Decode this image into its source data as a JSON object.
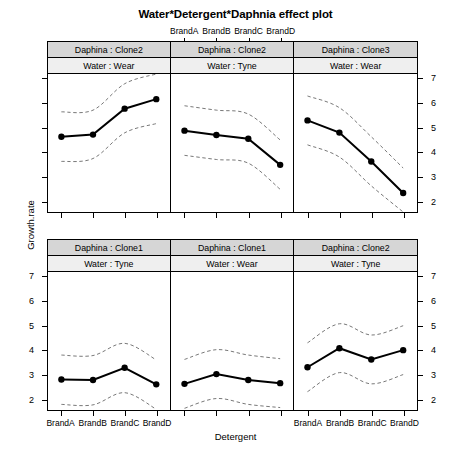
{
  "title": "Water*Detergent*Daphnia effect plot",
  "axes": {
    "xlabel": "Detergent",
    "ylabel": "Growth.rate",
    "categories": [
      "BrandA",
      "BrandB",
      "BrandC",
      "BrandD"
    ],
    "yticks": [
      "2",
      "3",
      "4",
      "5",
      "6",
      "7"
    ],
    "ylim": [
      1.55,
      7.2
    ]
  },
  "chart_data": {
    "type": "line",
    "title": "Water*Detergent*Daphnia effect plot",
    "xlabel": "Detergent",
    "ylabel": "Growth.rate",
    "categories": [
      "BrandA",
      "BrandB",
      "BrandC",
      "BrandD"
    ],
    "ylim": [
      1.55,
      7.2
    ],
    "yticks": [
      2,
      3,
      4,
      5,
      6,
      7
    ],
    "grid": false,
    "legend": null,
    "annotations": "Dashed lines are pointwise 95% confidence bands around each fitted effect line.",
    "panel_layout": {
      "rows": 2,
      "cols": 3
    },
    "panels": [
      {
        "position": "top-left",
        "strip_labels": [
          "Daphina : Clone2",
          "Water : Wear"
        ],
        "values": [
          4.63,
          4.72,
          5.78,
          6.17
        ],
        "lower": [
          3.62,
          3.74,
          4.79,
          5.17
        ],
        "upper": [
          5.65,
          5.72,
          6.8,
          7.2
        ]
      },
      {
        "position": "top-middle",
        "strip_labels": [
          "Daphina : Clone2",
          "Water : Tyne"
        ],
        "values": [
          4.88,
          4.7,
          4.55,
          3.48
        ],
        "lower": [
          3.87,
          3.7,
          3.55,
          2.48
        ],
        "upper": [
          5.9,
          5.72,
          5.56,
          4.5
        ]
      },
      {
        "position": "top-right",
        "strip_labels": [
          "Daphina : Clone3",
          "Water : Wear"
        ],
        "values": [
          5.3,
          4.8,
          3.62,
          2.33
        ],
        "lower": [
          4.3,
          3.8,
          2.62,
          1.55
        ],
        "upper": [
          6.3,
          5.82,
          4.63,
          3.35
        ]
      },
      {
        "position": "bottom-left",
        "strip_labels": [
          "Daphina : Clone1",
          "Water : Tyne"
        ],
        "values": [
          2.8,
          2.78,
          3.28,
          2.6
        ],
        "lower": [
          1.78,
          1.76,
          2.26,
          1.58
        ],
        "upper": [
          3.8,
          3.78,
          4.28,
          3.6
        ]
      },
      {
        "position": "bottom-middle",
        "strip_labels": [
          "Daphina : Clone1",
          "Water : Wear"
        ],
        "values": [
          2.62,
          3.02,
          2.78,
          2.65
        ],
        "lower": [
          1.62,
          2.02,
          1.78,
          1.65
        ],
        "upper": [
          3.62,
          4.02,
          3.8,
          3.65
        ]
      },
      {
        "position": "bottom-right",
        "strip_labels": [
          "Daphina : Clone2",
          "Water : Tyne"
        ],
        "values": [
          3.3,
          4.08,
          3.62,
          4.0
        ],
        "lower": [
          2.3,
          3.08,
          2.62,
          3.0
        ],
        "upper": [
          4.3,
          5.08,
          4.62,
          5.0
        ]
      }
    ]
  },
  "panel_strips": {
    "p0": {
      "top": "Daphina : Clone2",
      "bottom": "Water : Wear"
    },
    "p1": {
      "top": "Daphina : Clone2",
      "bottom": "Water : Tyne"
    },
    "p2": {
      "top": "Daphina : Clone3",
      "bottom": "Water : Wear"
    },
    "p3": {
      "top": "Daphina : Clone1",
      "bottom": "Water : Tyne"
    },
    "p4": {
      "top": "Daphina : Clone1",
      "bottom": "Water : Wear"
    },
    "p5": {
      "top": "Daphina : Clone2",
      "bottom": "Water : Tyne"
    }
  },
  "colors": {
    "line": "#000000",
    "band": "#555555",
    "strip_top": "#d6d6d6",
    "strip_bottom": "#efefef",
    "background": "#ffffff"
  }
}
